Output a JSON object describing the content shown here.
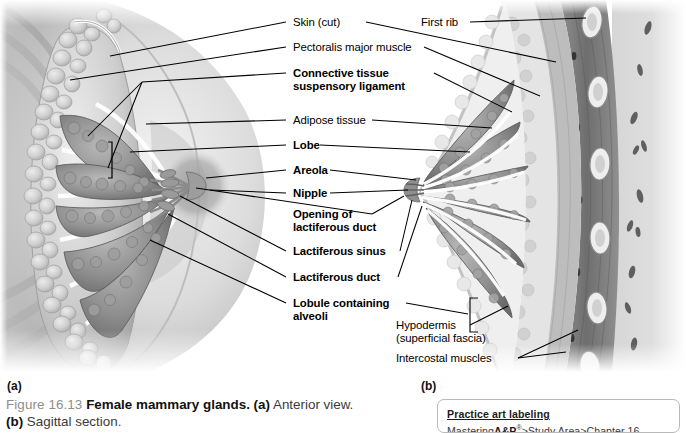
{
  "figure": {
    "number": "Figure 16.13",
    "title": "Female mammary glands.",
    "part_a_marker": "(a)",
    "part_a_text": "Anterior view.",
    "part_b_marker": "(b)",
    "part_b_text": "Sagittal section."
  },
  "panels": {
    "a_letter": "(a)",
    "b_letter": "(b)"
  },
  "labels_left": [
    {
      "text": "Skin (cut)",
      "bold": false
    },
    {
      "text": "Pectoralis major muscle",
      "bold": false
    },
    {
      "text": "Connective tissue",
      "bold": true
    },
    {
      "text": "suspensory ligament",
      "bold": true
    },
    {
      "text": "Adipose tissue",
      "bold": false
    },
    {
      "text": "Lobe",
      "bold": true
    },
    {
      "text": "Areola",
      "bold": true
    },
    {
      "text": "Nipple",
      "bold": true
    },
    {
      "text": "Opening of",
      "bold": true
    },
    {
      "text": "lactiferous duct",
      "bold": true
    },
    {
      "text": "Lactiferous sinus",
      "bold": true
    },
    {
      "text": "Lactiferous duct",
      "bold": true
    },
    {
      "text": "Lobule containing",
      "bold": true
    },
    {
      "text": "alveoli",
      "bold": true
    }
  ],
  "labels_right": [
    {
      "text": "First rib",
      "bold": false
    },
    {
      "text": "Hypodermis",
      "bold": false
    },
    {
      "text": "(superficial fascia)",
      "bold": false
    },
    {
      "text": "Intercostal muscles",
      "bold": false
    }
  ],
  "practice": {
    "heading": "Practice art labeling",
    "path_prefix": "Mastering",
    "path_brand": "A&P",
    "path_mark": "®",
    "path_rest": ">Study Area>Chapter 16"
  },
  "colors": {
    "leader_line": "#000000",
    "caption_number": "#8d8d8d",
    "caption_title": "#111111",
    "practice_border": "#b9b9b9",
    "tissue_dark": "#6f6f6f",
    "tissue_mid": "#a6a6a6",
    "tissue_light": "#d8d8d8",
    "skin_tone": "#cfcfcf",
    "background": "#ffffff"
  }
}
